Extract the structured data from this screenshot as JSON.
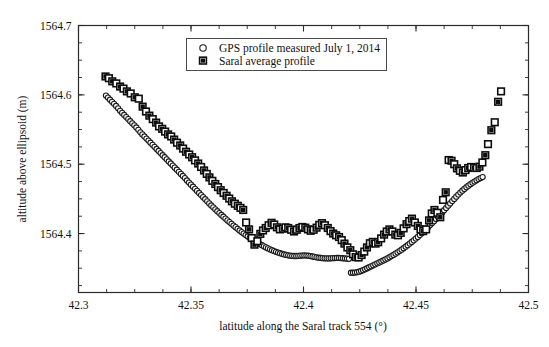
{
  "chart_data": {
    "type": "scatter",
    "title": "",
    "xlabel": "latitude along the Saral track 554 (°)",
    "ylabel": "altitude above ellipsoid (m)",
    "xlim": [
      42.3,
      42.5
    ],
    "ylim": [
      1564.315,
      1564.7
    ],
    "xticks": [
      "42.3",
      "42.35",
      "42.4",
      "42.45",
      "42.5"
    ],
    "xtick_values": [
      42.3,
      42.35,
      42.4,
      42.45,
      42.5
    ],
    "yticks": [
      "1564.7",
      "1564.6",
      "1564.5",
      "1564.4"
    ],
    "ytick_values": [
      1564.7,
      1564.6,
      1564.5,
      1564.4
    ],
    "xminor_step": 0.0125,
    "yminor_step": 0.025,
    "grid": false,
    "legend_position": "upper-center",
    "series": [
      {
        "name": "GPS profile measured July 1, 2014",
        "marker": "circle-open",
        "color": "#1a1a1a",
        "x": [
          42.3122,
          42.3131,
          42.314,
          42.3149,
          42.3158,
          42.3167,
          42.3176,
          42.3185,
          42.3194,
          42.3203,
          42.3212,
          42.3221,
          42.323,
          42.3239,
          42.3248,
          42.3257,
          42.3266,
          42.3275,
          42.3284,
          42.3293,
          42.3302,
          42.3311,
          42.332,
          42.3329,
          42.3338,
          42.3347,
          42.3356,
          42.3365,
          42.3374,
          42.3383,
          42.3392,
          42.3401,
          42.341,
          42.3419,
          42.3428,
          42.3437,
          42.3446,
          42.3455,
          42.3464,
          42.3473,
          42.3482,
          42.3491,
          42.35,
          42.3509,
          42.3518,
          42.3527,
          42.3536,
          42.3545,
          42.3554,
          42.3563,
          42.3572,
          42.3581,
          42.359,
          42.3599,
          42.3608,
          42.3617,
          42.3626,
          42.3635,
          42.3644,
          42.3653,
          42.3662,
          42.3671,
          42.368,
          42.3689,
          42.3698,
          42.3707,
          42.3716,
          42.3725,
          42.3734,
          42.3743,
          42.3752,
          42.3761,
          42.377,
          42.3779,
          42.3788,
          42.3797,
          42.3806,
          42.3815,
          42.3824,
          42.3833,
          42.3842,
          42.3851,
          42.386,
          42.3869,
          42.3878,
          42.3887,
          42.3896,
          42.3905,
          42.3914,
          42.3923,
          42.3932,
          42.3941,
          42.395,
          42.3959,
          42.3968,
          42.3977,
          42.3986,
          42.3995,
          42.4004,
          42.4013,
          42.4022,
          42.4031,
          42.404,
          42.4049,
          42.4058,
          42.4067,
          42.4076,
          42.4085,
          42.4094,
          42.4103,
          42.4112,
          42.4121,
          42.413,
          42.4139,
          42.4148,
          42.4157,
          42.4166,
          42.4175,
          42.4184,
          42.4193,
          42.4202,
          42.4211,
          42.422,
          42.4229,
          42.4238,
          42.4247,
          42.4256,
          42.4265,
          42.4274,
          42.4283,
          42.4292,
          42.4301,
          42.431,
          42.4319,
          42.4328,
          42.4337,
          42.4346,
          42.4355,
          42.4364,
          42.4373,
          42.4382,
          42.4391,
          42.44,
          42.4409,
          42.4418,
          42.4427,
          42.4436,
          42.4445,
          42.4454,
          42.4463,
          42.4472,
          42.4481,
          42.449,
          42.4499,
          42.4508,
          42.4517,
          42.4526,
          42.4535,
          42.4544,
          42.4553,
          42.4562,
          42.4571,
          42.458,
          42.4589,
          42.4598,
          42.4607,
          42.4616,
          42.4625,
          42.4634,
          42.4643,
          42.4652,
          42.4661,
          42.467,
          42.4679,
          42.4688,
          42.4697,
          42.4706,
          42.4715,
          42.4724,
          42.4733,
          42.4742,
          42.4751,
          42.476,
          42.4769,
          42.4778,
          42.4787,
          42.4796
        ],
        "y": [
          1564.599,
          1564.596,
          1564.593,
          1564.59,
          1564.587,
          1564.584,
          1564.5805,
          1564.577,
          1564.574,
          1564.571,
          1564.568,
          1564.565,
          1564.562,
          1564.559,
          1564.556,
          1564.553,
          1564.5495,
          1564.546,
          1564.543,
          1564.54,
          1564.537,
          1564.534,
          1564.531,
          1564.528,
          1564.525,
          1564.522,
          1564.519,
          1564.516,
          1564.513,
          1564.51,
          1564.507,
          1564.504,
          1564.501,
          1564.498,
          1564.495,
          1564.492,
          1564.489,
          1564.486,
          1564.483,
          1564.48,
          1564.4765,
          1564.4735,
          1564.4705,
          1564.4675,
          1564.4645,
          1564.4615,
          1564.4585,
          1564.4555,
          1564.4525,
          1564.4495,
          1564.4465,
          1564.4435,
          1564.4405,
          1564.4378,
          1564.435,
          1564.4322,
          1564.4295,
          1564.4268,
          1564.4242,
          1564.4216,
          1564.419,
          1564.4165,
          1564.414,
          1564.4115,
          1564.4092,
          1564.4068,
          1564.4045,
          1564.4022,
          1564.4,
          1564.3978,
          1564.3958,
          1564.3938,
          1564.3918,
          1564.39,
          1564.3882,
          1564.3865,
          1564.3848,
          1564.3832,
          1564.3816,
          1564.38,
          1564.3786,
          1564.3772,
          1564.376,
          1564.3748,
          1564.3736,
          1564.3726,
          1564.3716,
          1564.3707,
          1564.3699,
          1564.3692,
          1564.3686,
          1564.3681,
          1564.3678,
          1564.3676,
          1564.3676,
          1564.3678,
          1564.3681,
          1564.3683,
          1564.3684,
          1564.3683,
          1564.368,
          1564.3675,
          1564.3669,
          1564.3663,
          1564.3657,
          1564.3652,
          1564.3648,
          1564.3645,
          1564.3643,
          1564.3642,
          1564.3642,
          1564.3643,
          1564.3645,
          1564.3647,
          1564.3648,
          1564.3648,
          1564.3646,
          1564.3644,
          1564.3641,
          1564.3638,
          1564.3636,
          1564.3435,
          1564.3435,
          1564.3438,
          1564.3443,
          1564.345,
          1564.346,
          1564.3472,
          1564.3486,
          1564.35,
          1564.3514,
          1564.3528,
          1564.3542,
          1564.3556,
          1564.357,
          1564.3584,
          1564.3598,
          1564.3612,
          1564.3627,
          1564.3642,
          1564.3658,
          1564.3675,
          1564.3692,
          1564.371,
          1564.3729,
          1564.3748,
          1564.3768,
          1564.3789,
          1564.381,
          1564.3832,
          1564.3855,
          1564.3878,
          1564.3902,
          1564.3927,
          1564.3952,
          1564.3978,
          1564.4005,
          1564.4032,
          1564.406,
          1564.4089,
          1564.4118,
          1564.4148,
          1564.4178,
          1564.4209,
          1564.424,
          1564.4272,
          1564.4304,
          1564.4336,
          1564.4369,
          1564.4402,
          1564.4435,
          1564.4468,
          1564.45,
          1564.4532,
          1564.4562,
          1564.4591,
          1564.4618,
          1564.4644,
          1564.4668,
          1564.4691,
          1564.4712,
          1564.4732,
          1564.475,
          1564.4768,
          1564.4785,
          1564.48,
          1564.4815
        ]
      },
      {
        "name": "Saral average profile",
        "marker": "square",
        "color": "#0d0d0d",
        "x": [
          42.312,
          42.3135,
          42.315,
          42.3168,
          42.3185,
          42.32,
          42.3215,
          42.3232,
          42.325,
          42.3268,
          42.3285,
          42.33,
          42.3315,
          42.333,
          42.3345,
          42.3358,
          42.3372,
          42.3385,
          42.3398,
          42.3412,
          42.3425,
          42.3438,
          42.3452,
          42.3465,
          42.3478,
          42.3492,
          42.3505,
          42.3518,
          42.3532,
          42.3545,
          42.3558,
          42.357,
          42.3582,
          42.3595,
          42.3608,
          42.362,
          42.3632,
          42.3645,
          42.3658,
          42.367,
          42.3682,
          42.3695,
          42.3708,
          42.372,
          42.3732,
          42.3745,
          42.3758,
          42.377,
          42.3782,
          42.3795,
          42.3808,
          42.382,
          42.3832,
          42.3845,
          42.3858,
          42.387,
          42.3882,
          42.3895,
          42.3908,
          42.392,
          42.3932,
          42.3945,
          42.3958,
          42.397,
          42.3982,
          42.3995,
          42.4008,
          42.402,
          42.4032,
          42.4045,
          42.4058,
          42.407,
          42.4082,
          42.4095,
          42.4108,
          42.412,
          42.4132,
          42.4145,
          42.4158,
          42.417,
          42.4182,
          42.4195,
          42.4208,
          42.422,
          42.4232,
          42.4245,
          42.4258,
          42.427,
          42.4282,
          42.4295,
          42.4308,
          42.432,
          42.4332,
          42.4345,
          42.4358,
          42.437,
          42.4382,
          42.4395,
          42.4408,
          42.442,
          42.4432,
          42.4445,
          42.4458,
          42.447,
          42.4482,
          42.4495,
          42.4508,
          42.452,
          42.4532,
          42.4545,
          42.4558,
          42.457,
          42.4582,
          42.4595,
          42.4608,
          42.462,
          42.4632,
          42.4645,
          42.4658,
          42.467,
          42.4682,
          42.4695,
          42.4708,
          42.472,
          42.4732,
          42.4745,
          42.4758,
          42.477,
          42.4782,
          42.4795,
          42.4808,
          42.482,
          42.4835,
          42.485,
          42.4865,
          42.4878
        ],
        "y": [
          1564.6265,
          1564.624,
          1564.6195,
          1564.6165,
          1564.612,
          1564.609,
          1564.605,
          1564.602,
          1564.5965,
          1564.5945,
          1564.583,
          1564.576,
          1564.57,
          1564.565,
          1564.56,
          1564.5545,
          1564.551,
          1564.547,
          1564.543,
          1564.54,
          1564.5355,
          1564.531,
          1564.527,
          1564.5225,
          1564.518,
          1564.514,
          1564.51,
          1564.5055,
          1564.501,
          1564.496,
          1564.491,
          1564.486,
          1564.481,
          1564.476,
          1564.4715,
          1564.467,
          1564.4625,
          1564.4585,
          1564.4545,
          1564.4505,
          1564.4465,
          1564.443,
          1564.44,
          1564.437,
          1564.434,
          1564.416,
          1564.406,
          1564.3935,
          1564.384,
          1564.389,
          1564.3995,
          1564.4045,
          1564.408,
          1564.412,
          1564.4155,
          1564.413,
          1564.409,
          1564.406,
          1564.407,
          1564.409,
          1564.408,
          1564.4055,
          1564.403,
          1564.4055,
          1564.408,
          1564.4095,
          1564.4085,
          1564.406,
          1564.404,
          1564.4055,
          1564.4085,
          1564.4125,
          1564.415,
          1564.412,
          1564.408,
          1564.4035,
          1564.4,
          1564.3975,
          1564.395,
          1564.3905,
          1564.3855,
          1564.38,
          1564.376,
          1564.37,
          1564.366,
          1564.3655,
          1564.369,
          1564.374,
          1564.38,
          1564.386,
          1564.388,
          1564.3855,
          1564.3875,
          1564.393,
          1564.3985,
          1564.403,
          1564.406,
          1564.403,
          1564.3985,
          1564.3975,
          1564.401,
          1564.4075,
          1564.4135,
          1564.418,
          1564.4215,
          1564.416,
          1564.411,
          1564.406,
          1564.4035,
          1564.406,
          1564.419,
          1564.429,
          1564.434,
          1564.43,
          1564.4235,
          1564.4485,
          1564.4595,
          1564.506,
          1564.505,
          1564.5,
          1564.494,
          1564.4905,
          1564.488,
          1564.4915,
          1564.4945,
          1564.496,
          1564.495,
          1564.4945,
          1564.4965,
          1564.5025,
          1564.513,
          1564.529,
          1564.549,
          1564.5605,
          1564.59,
          1564.605
        ]
      }
    ]
  },
  "legend": {
    "entries": [
      {
        "label": "GPS profile measured July 1, 2014",
        "marker": "circle-open"
      },
      {
        "label": "Saral average profile",
        "marker": "square-filled"
      }
    ]
  },
  "axes": {
    "x_title": "latitude along the Saral track 554 (°)",
    "y_title": "altitude above ellipsoid (m)"
  }
}
